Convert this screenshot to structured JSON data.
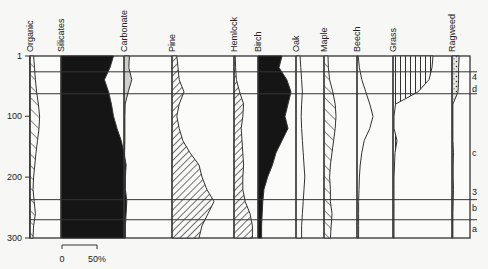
{
  "chart_data": {
    "type": "area",
    "title": "",
    "ylabel": "Depth",
    "xlabel": "",
    "ylim": [
      300,
      1
    ],
    "y_ticks": [
      "1",
      "100",
      "200",
      "300"
    ],
    "scale_bar": {
      "start": "0",
      "end": "50%"
    },
    "zone_labels": [
      {
        "label": "4",
        "depth": 35
      },
      {
        "label": "d",
        "depth": 55
      },
      {
        "label": "c",
        "depth": 160
      },
      {
        "label": "3",
        "depth": 225
      },
      {
        "label": "b",
        "depth": 250
      },
      {
        "label": "a",
        "depth": 285
      }
    ],
    "zone_boundaries": [
      27,
      63,
      237,
      270
    ],
    "depths": [
      1,
      20,
      40,
      60,
      80,
      100,
      120,
      140,
      160,
      180,
      200,
      220,
      240,
      260,
      280,
      300
    ],
    "series": [
      {
        "name": "Organic",
        "pattern": "hatch",
        "values": [
          12,
          15,
          18,
          22,
          28,
          32,
          30,
          25,
          20,
          16,
          12,
          10,
          14,
          18,
          12,
          10
        ]
      },
      {
        "name": "Silicates",
        "pattern": "solid-black",
        "values": [
          75,
          70,
          62,
          68,
          72,
          75,
          80,
          86,
          90,
          93,
          92,
          92,
          94,
          93,
          92,
          92
        ]
      },
      {
        "name": "Carbonate",
        "pattern": "stipple-gray",
        "values": [
          18,
          16,
          26,
          14,
          4,
          3,
          3,
          3,
          2,
          2,
          2,
          2,
          2,
          2,
          2,
          2
        ]
      },
      {
        "name": "Pine",
        "pattern": "hatch",
        "values": [
          8,
          10,
          12,
          20,
          12,
          8,
          12,
          18,
          30,
          45,
          50,
          58,
          70,
          60,
          50,
          45
        ]
      },
      {
        "name": "Hemlock",
        "pattern": "hatch",
        "values": [
          3,
          4,
          6,
          14,
          24,
          22,
          18,
          20,
          22,
          24,
          22,
          22,
          28,
          40,
          46,
          46
        ]
      },
      {
        "name": "Birch",
        "pattern": "solid-black",
        "values": [
          40,
          35,
          48,
          55,
          50,
          45,
          50,
          40,
          30,
          24,
          16,
          10,
          8,
          7,
          6,
          6
        ]
      },
      {
        "name": "Oak",
        "pattern": "outline",
        "values": [
          10,
          12,
          14,
          16,
          14,
          13,
          14,
          16,
          18,
          20,
          22,
          20,
          18,
          16,
          14,
          14
        ]
      },
      {
        "name": "Maple",
        "pattern": "hatch",
        "values": [
          10,
          11,
          14,
          22,
          28,
          30,
          28,
          24,
          20,
          16,
          14,
          16,
          16,
          20,
          18,
          16
        ]
      },
      {
        "name": "Beech",
        "pattern": "outline",
        "values": [
          3,
          6,
          12,
          22,
          32,
          40,
          32,
          18,
          12,
          8,
          6,
          5,
          4,
          4,
          4,
          4
        ]
      },
      {
        "name": "Grass",
        "pattern": "vertical-lines",
        "values": [
          80,
          78,
          72,
          50,
          5,
          2,
          2,
          8,
          4,
          3,
          2,
          2,
          2,
          2,
          2,
          2
        ]
      },
      {
        "name": "Ragweed",
        "pattern": "dots",
        "values": [
          24,
          22,
          22,
          20,
          3,
          3,
          3,
          3,
          5,
          4,
          4,
          5,
          4,
          3,
          3,
          3
        ]
      }
    ],
    "grid": false,
    "legend": "column headers"
  }
}
